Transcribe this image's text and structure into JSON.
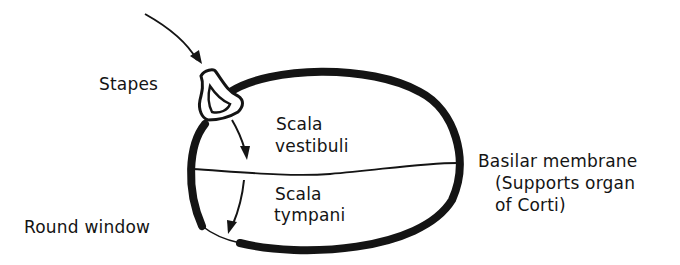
{
  "diagram": {
    "labels": {
      "stapes": "Stapes",
      "round_window": "Round window",
      "scala_vestibuli_line1": "Scala",
      "scala_vestibuli_line2": "vestibuli",
      "scala_tympani_line1": "Scala",
      "scala_tympani_line2": "tympani",
      "basilar_line1": "Basilar membrane",
      "basilar_line2": "(Supports organ",
      "basilar_line3": "of Corti)"
    },
    "colors": {
      "ink": "#141414",
      "background": "#ffffff"
    },
    "elements": [
      {
        "name": "incoming-arrow",
        "description": "curved arrow pointing at stapes"
      },
      {
        "name": "stapes",
        "description": "stirrup-shaped bone at oval window"
      },
      {
        "name": "cochlea-wall",
        "description": "thick oval outline"
      },
      {
        "name": "basilar-membrane",
        "description": "thin line dividing the oval horizontally"
      },
      {
        "name": "vestibuli-arrow",
        "description": "arrow pointing down in upper chamber"
      },
      {
        "name": "tympani-arrow",
        "description": "arrow pointing down to round window"
      },
      {
        "name": "round-window",
        "description": "thin membrane gap at lower left of oval"
      }
    ]
  }
}
